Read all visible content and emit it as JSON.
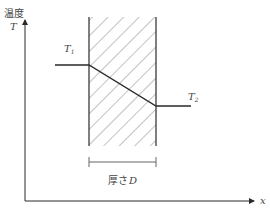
{
  "diagram": {
    "axis_y_label_top": "温度",
    "axis_y_label": "T",
    "axis_x_label": "x",
    "t1_label": "T",
    "t1_sub": "1",
    "t2_label": "T",
    "t2_sub": "2",
    "thickness_label": "厚さ",
    "thickness_var": "D"
  },
  "colors": {
    "line": "#2a2a2a",
    "hatch": "#555555",
    "text": "#444444"
  }
}
